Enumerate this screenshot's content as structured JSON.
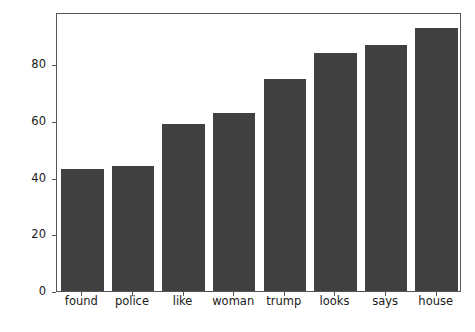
{
  "chart_data": {
    "type": "bar",
    "title": "",
    "subtitle": "",
    "xlabel": "",
    "ylabel": "",
    "categories": [
      "found",
      "police",
      "like",
      "woman",
      "trump",
      "looks",
      "says",
      "house"
    ],
    "values": [
      43,
      44,
      59,
      63,
      75,
      84,
      87,
      93
    ],
    "series": [
      {
        "name": "word frequency",
        "values": [
          43,
          44,
          59,
          63,
          75,
          84,
          87,
          93
        ]
      }
    ],
    "ylim": [
      0,
      98.5
    ],
    "xlim": [
      -0.5,
      7.5
    ],
    "ytick_labels": [
      "0",
      "20",
      "40",
      "60",
      "80"
    ],
    "ytick_values": [
      0,
      20,
      40,
      60,
      80
    ],
    "grid": false,
    "legend": false,
    "legend_position": "none",
    "bar_color": "#404040",
    "axes_color": "#555555",
    "background_color": "#ffffff",
    "bar_width_fraction": 0.84,
    "annotations": []
  }
}
